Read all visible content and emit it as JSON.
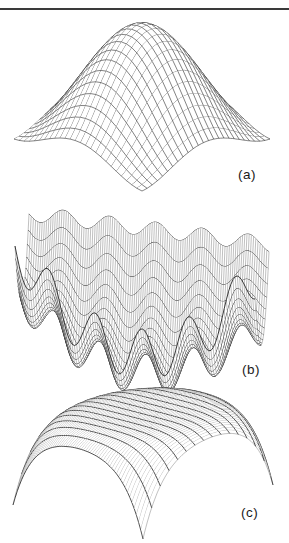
{
  "page": {
    "background": "#ffffff",
    "top_rule_color": "#3a3a3a"
  },
  "colors": {
    "line": "#1b1b1b",
    "surface_fill": "#ffffff"
  },
  "panels": [
    {
      "id": "a",
      "label": "(a)"
    },
    {
      "id": "b",
      "label": "(b)"
    },
    {
      "id": "c",
      "label": "(c)"
    }
  ],
  "chart_data": [
    {
      "type": "surface3d_wireframe",
      "panel_label": "(a)",
      "kind": "dome",
      "description": "Smooth unimodal dome: z = cos(2.2*sqrt(x^2+y^2)) over square domain; all four corners droop to z = -1; rear corner hidden behind crest forms V-notch; uniform square mesh",
      "params": {
        "k": 2.2
      },
      "domain": {
        "x": [
          -1,
          1
        ],
        "y": [
          -1,
          1
        ]
      },
      "z_range": [
        -1,
        1
      ],
      "grid": {
        "x_samples": 76,
        "rows": 26,
        "column_step": 3
      },
      "projection": {
        "type": "diamond",
        "cx": 142,
        "cy": 82,
        "a": 64,
        "b": 26,
        "h": 57,
        "tilt": 0
      },
      "stroke": {
        "row": 0.55,
        "col": 0.55
      }
    },
    {
      "type": "surface3d_wireframe",
      "panel_label": "(b)",
      "kind": "wavy_valley",
      "description": "Multimodal wavy valley: shallow bowl with ~5 cosine ripple ridges along x; ripple amplitude grows toward the front; heavy wavy constant-depth contour lines, dense fine lines across",
      "params": {
        "b1": 0.15,
        "b2": 0.22,
        "tx": -0.05,
        "a0": 0.025,
        "a1": 0.0275,
        "k": 16.3,
        "xc": 0.25
      },
      "domain": {
        "x": [
          -1,
          1
        ],
        "y": [
          -1,
          1
        ]
      },
      "z_range": [
        -0.06,
        0.62
      ],
      "grid": {
        "x_samples": 110,
        "rows": 19,
        "column_step": 1
      },
      "projection": {
        "type": "frontal",
        "cx": 142,
        "cy": 359,
        "a": 120,
        "lean": 7,
        "h": 309,
        "d": 62
      },
      "stroke": {
        "row": 0.85,
        "col": 0.28
      }
    },
    {
      "type": "surface3d_wireframe",
      "panel_label": "(c)",
      "kind": "plateau",
      "description": "Flat-topped plateau: z = 1 - 0.35*r^6; edges fall away steeply and front corner plunges to a sharp needle spike; very dense thin lines one way, sparse heavy contour lines the other",
      "params": {
        "c": 0.35,
        "pow": 6
      },
      "domain": {
        "x": [
          -1,
          1
        ],
        "y": [
          -1,
          1
        ]
      },
      "z_range": [
        -1.8,
        1
      ],
      "grid": {
        "x_samples": 91,
        "rows": 60,
        "column_step": 6
      },
      "projection": {
        "type": "diamond",
        "cx": 143,
        "cy": 441,
        "a": 65,
        "b": 22,
        "h": 30,
        "tilt": -5
      },
      "stroke": {
        "row": 0.28,
        "col": 0.75
      }
    }
  ]
}
